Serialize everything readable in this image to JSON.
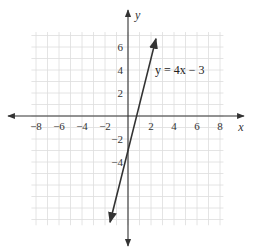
{
  "chart_data": {
    "type": "line",
    "title": "",
    "xlabel": "x",
    "ylabel": "y",
    "xlim": [
      -8.4,
      8.3
    ],
    "ylim": [
      -9.5,
      7.3
    ],
    "grid": true,
    "x_ticks": [
      -8,
      -6,
      -4,
      -2,
      2,
      4,
      6,
      8
    ],
    "y_ticks": [
      6,
      4,
      2,
      -2,
      -4
    ],
    "series": [
      {
        "name": "y = 4x − 3",
        "equation": "y = 4x - 3",
        "slope": 4,
        "intercept": -3,
        "x": [
          -1.56,
          2.43
        ],
        "y": [
          -9.24,
          6.72
        ]
      }
    ],
    "annotations": [
      {
        "text": "y = 4x − 3",
        "x": 2.2,
        "y": 4
      }
    ],
    "colors": {
      "grid": "#dddddd",
      "axis": "#333333",
      "line": "#333333"
    }
  },
  "labels": {
    "x_axis": "x",
    "y_axis": "y",
    "equation": "y = 4x − 3"
  }
}
